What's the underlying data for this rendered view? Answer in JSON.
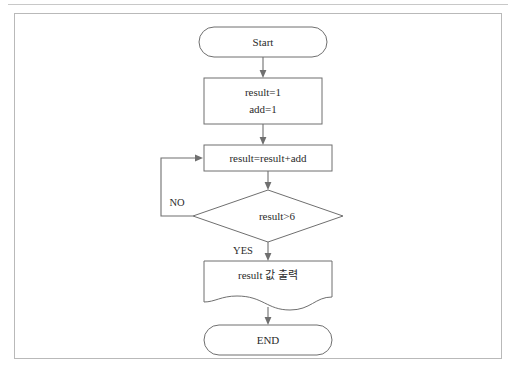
{
  "figure": {
    "kind": "flowchart",
    "nodes": [
      {
        "id": "start",
        "type": "terminator",
        "label": "Start"
      },
      {
        "id": "init1",
        "type": "process",
        "label": "result=1"
      },
      {
        "id": "init2",
        "type": "process",
        "label": "add=1"
      },
      {
        "id": "accum",
        "type": "process",
        "label": "result=result+add"
      },
      {
        "id": "decision",
        "type": "decision",
        "label": "result>6"
      },
      {
        "id": "output",
        "type": "document",
        "label": "result 값 출력"
      },
      {
        "id": "end",
        "type": "terminator",
        "label": "END"
      }
    ],
    "branch_labels": {
      "no": "NO",
      "yes": "YES"
    },
    "colors": {
      "stroke": "#6f6f6f",
      "text": "#2b2b2b",
      "frame": "#b9b9b9",
      "rule": "#c8c8c8",
      "background": "#ffffff"
    }
  }
}
